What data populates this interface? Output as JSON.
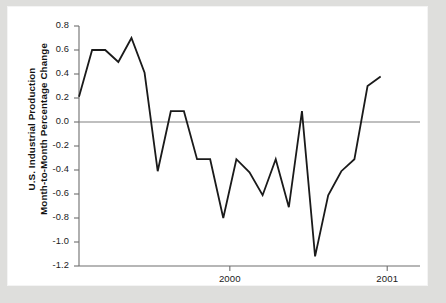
{
  "chart_data": {
    "type": "line",
    "title": "",
    "xlabel": "",
    "ylabel": "U.S. Industrial Production\nMonth-to-Month Percentage Change",
    "ylim": [
      -1.2,
      0.8
    ],
    "ytick_labels": [
      "0.8",
      "0.6",
      "0.4",
      "0.2",
      "0.0",
      "-0.2",
      "-0.4",
      "-0.6",
      "-0.8",
      "-1.0",
      "-1.2"
    ],
    "ytick_values": [
      0.8,
      0.6,
      0.4,
      0.2,
      0.0,
      -0.2,
      -0.4,
      -0.6,
      -0.8,
      -1.0,
      -1.2
    ],
    "xtick_labels": [
      "2000",
      "2001"
    ],
    "xtick_values": [
      11.5,
      23.5
    ],
    "xlim": [
      0,
      26
    ],
    "grid": false,
    "zero_line": true,
    "zero_line_color": "#808080",
    "line_color": "#1a1a1a",
    "line_width": 1.8,
    "legend": null,
    "series": [
      {
        "name": "U.S. Industrial Production Month-to-Month Percentage Change",
        "x": [
          0,
          1,
          2,
          3,
          4,
          5,
          6,
          7,
          8,
          9,
          10,
          11,
          12,
          13,
          14,
          15,
          16,
          17,
          18,
          19,
          20,
          21,
          22,
          23,
          24,
          25,
          26
        ],
        "values": [
          0.21,
          0.6,
          0.6,
          0.5,
          0.7,
          0.41,
          -0.41,
          0.09,
          0.09,
          -0.31,
          -0.31,
          -0.8,
          -0.31,
          -0.42,
          -0.61,
          -0.31,
          -0.71,
          0.09,
          -1.12,
          -0.61,
          -0.41,
          -0.31,
          0.3,
          0.38,
          null,
          null,
          null
        ]
      }
    ]
  },
  "figure": {
    "background_color": "#dededc",
    "panel_color": "#ffffff",
    "axis_color": "#6e6e6e"
  }
}
